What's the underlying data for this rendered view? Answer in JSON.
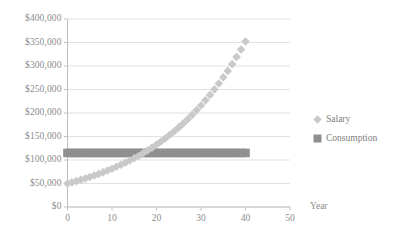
{
  "chart_data": {
    "type": "scatter",
    "title": "",
    "xlabel": "Year",
    "ylabel": "",
    "xlim": [
      0,
      50
    ],
    "ylim": [
      0,
      400000
    ],
    "grid": true,
    "grid_axis": "y",
    "legend_position": "right",
    "background": "#ffffff",
    "x_tick_labels": [
      "0",
      "10",
      "20",
      "30",
      "40",
      "50"
    ],
    "x_tick_values": [
      0,
      10,
      20,
      30,
      40,
      50
    ],
    "y_tick_labels": [
      "$0",
      "$50,000",
      "$100,000",
      "$150,000",
      "$200,000",
      "$250,000",
      "$300,000",
      "$350,000",
      "$400,000"
    ],
    "y_tick_values": [
      0,
      50000,
      100000,
      150000,
      200000,
      250000,
      300000,
      350000,
      400000
    ],
    "series": [
      {
        "name": "Salary",
        "marker": "diamond",
        "color": "#c9c9c9",
        "x": [
          0,
          1,
          2,
          3,
          4,
          5,
          6,
          7,
          8,
          9,
          10,
          11,
          12,
          13,
          14,
          15,
          16,
          17,
          18,
          19,
          20,
          21,
          22,
          23,
          24,
          25,
          26,
          27,
          28,
          29,
          30,
          31,
          32,
          33,
          34,
          35,
          36,
          37,
          38,
          39,
          40
        ],
        "values": [
          50000,
          52500,
          55125,
          57881,
          60775,
          63814,
          67005,
          70355,
          73873,
          77566,
          81445,
          85517,
          89793,
          94283,
          98997,
          103947,
          109144,
          114601,
          120331,
          126348,
          132665,
          139299,
          146264,
          153577,
          161256,
          169318,
          177784,
          186673,
          196007,
          205807,
          216097,
          226902,
          238247,
          250160,
          262668,
          275801,
          289591,
          304071,
          319274,
          335238,
          352000
        ]
      },
      {
        "name": "Consumption",
        "marker": "square",
        "color": "#8f8f8f",
        "x": [
          0,
          1,
          2,
          3,
          4,
          5,
          6,
          7,
          8,
          9,
          10,
          11,
          12,
          13,
          14,
          15,
          16,
          17,
          18,
          19,
          20,
          21,
          22,
          23,
          24,
          25,
          26,
          27,
          28,
          29,
          30,
          31,
          32,
          33,
          34,
          35,
          36,
          37,
          38,
          39,
          40
        ],
        "values": [
          115000,
          115000,
          115000,
          115000,
          115000,
          115000,
          115000,
          115000,
          115000,
          115000,
          115000,
          115000,
          115000,
          115000,
          115000,
          115000,
          115000,
          115000,
          115000,
          115000,
          115000,
          115000,
          115000,
          115000,
          115000,
          115000,
          115000,
          115000,
          115000,
          115000,
          115000,
          115000,
          115000,
          115000,
          115000,
          115000,
          115000,
          115000,
          115000,
          115000,
          115000
        ]
      }
    ],
    "legend": [
      {
        "label": "Salary",
        "marker": "diamond",
        "color": "#c9c9c9"
      },
      {
        "label": "Consumption",
        "marker": "square",
        "color": "#8f8f8f"
      }
    ],
    "colors": {
      "salary": "#c9c9c9",
      "consumption": "#8f8f8f",
      "gridline": "#d9d9d9",
      "axis": "#c0c0c0",
      "tick_text": "#8c8c8c"
    }
  }
}
